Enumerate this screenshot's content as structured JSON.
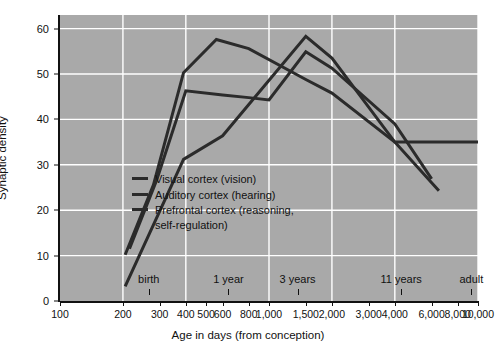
{
  "figure": {
    "background": "#ffffff",
    "plot_background": "#a9a9a9",
    "grid_color": "#ffffff",
    "line_color": "#2b2b2b",
    "axis_color": "#111111"
  },
  "axes": {
    "ylabel": "Synaptic density",
    "xlabel": "Age in days (from conception)",
    "y_ticks": [
      "0",
      "10",
      "20",
      "30",
      "40",
      "50",
      "60"
    ],
    "y_tick_values": [
      0,
      10,
      20,
      30,
      40,
      50,
      60
    ],
    "ylim": [
      0,
      63
    ],
    "x_ticks": [
      "100",
      "200",
      "300",
      "400",
      "500",
      "600",
      "800",
      "1,000",
      "1,500",
      "2,000",
      "3,000",
      "4,000",
      "6,000",
      "8,000",
      "10,000"
    ],
    "x_tick_values": [
      100,
      200,
      300,
      400,
      500,
      600,
      800,
      1000,
      1500,
      2000,
      3000,
      4000,
      6000,
      8000,
      10000
    ],
    "xlim": [
      100,
      10000
    ],
    "x_scale": "log",
    "top_annotations": [
      {
        "label": "birth",
        "x": 266
      },
      {
        "label": "1 year",
        "x": 640
      },
      {
        "label": "3 years",
        "x": 1370
      },
      {
        "label": "11 years",
        "x": 4290
      },
      {
        "label": "adult",
        "x": 9300
      }
    ]
  },
  "legend": {
    "position": "inside-lower-left",
    "entries": [
      {
        "label": "Visual cortex (vision)",
        "color": "#2b2b2b"
      },
      {
        "label": "Auditory cortex (hearing)",
        "color": "#2b2b2b"
      },
      {
        "label": "Prefrontal cortex (reasoning,\nself-regulation)",
        "color": "#2b2b2b"
      }
    ]
  },
  "chart_data": {
    "type": "line",
    "title": "",
    "xlabel": "Age in days (from conception)",
    "ylabel": "Synaptic density",
    "xlim": [
      100,
      10000
    ],
    "ylim": [
      0,
      63
    ],
    "x_scale": "log",
    "grid": true,
    "legend_position": "inside-lower-left",
    "series": [
      {
        "name": "Visual cortex (vision)",
        "color": "#2b2b2b",
        "points": [
          {
            "x": 205,
            "y": 10.2
          },
          {
            "x": 280,
            "y": 25.6
          },
          {
            "x": 390,
            "y": 50.3
          },
          {
            "x": 560,
            "y": 57.6
          },
          {
            "x": 800,
            "y": 55.6
          },
          {
            "x": 1500,
            "y": 48.8
          },
          {
            "x": 2000,
            "y": 45.8
          },
          {
            "x": 4000,
            "y": 35.0
          },
          {
            "x": 6500,
            "y": 24.3
          }
        ]
      },
      {
        "name": "Auditory cortex (hearing)",
        "color": "#2b2b2b",
        "points": [
          {
            "x": 215,
            "y": 11.5
          },
          {
            "x": 290,
            "y": 26.6
          },
          {
            "x": 400,
            "y": 46.3
          },
          {
            "x": 600,
            "y": 45.4
          },
          {
            "x": 800,
            "y": 44.8
          },
          {
            "x": 1000,
            "y": 44.3
          },
          {
            "x": 1500,
            "y": 54.9
          },
          {
            "x": 2000,
            "y": 51.3
          },
          {
            "x": 4000,
            "y": 39.0
          },
          {
            "x": 6000,
            "y": 26.9
          }
        ]
      },
      {
        "name": "Prefrontal cortex (reasoning, self-regulation)",
        "color": "#2b2b2b",
        "points": [
          {
            "x": 205,
            "y": 3.2
          },
          {
            "x": 390,
            "y": 31.2
          },
          {
            "x": 600,
            "y": 36.4
          },
          {
            "x": 1500,
            "y": 58.3
          },
          {
            "x": 2000,
            "y": 53.5
          },
          {
            "x": 4000,
            "y": 35.0
          },
          {
            "x": 10000,
            "y": 35.0
          }
        ]
      }
    ]
  }
}
